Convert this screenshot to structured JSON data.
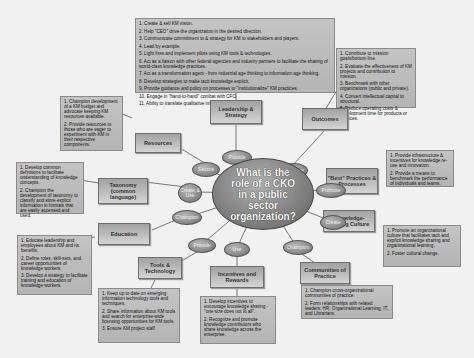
{
  "center": {
    "title": "What is the role of a CKO in a public sector organization?"
  },
  "nodes": {
    "leadership": "Leadership & Strategy",
    "outcomes": "Outcomes",
    "resources": "Resources",
    "taxonomy": "Taxonomy (common language)",
    "best_practices": "\"Best\" Practices & Processes",
    "knowledge_culture": "Knowledge-sharing Culture",
    "education": "Education",
    "tools": "Tools & Technology",
    "incentives": "Incentives and Rewards",
    "communities": "Communities of Practice"
  },
  "verbs": {
    "provide_top": "Provide",
    "secure": "Secure",
    "measure": "Measure",
    "create_use": "Create & Use",
    "promote": "Promote",
    "champion_left": "Champion",
    "create_right": "Create",
    "provide_bottom": "Provide",
    "use": "Use",
    "champion_right": "Champion"
  },
  "boxes": {
    "leadership": [
      "1. Create & sell KM vision.",
      "2. Help \"CEO\" drive the organization in the desired direction.",
      "3. Communicate commitment to & strategy for KM to stakeholders and players.",
      "4. Lead by example.",
      "5. Light fires and implement pilots using KM tools & technologies.",
      "6. Act as a liaison with other federal agencies and industry partners to facilitate the sharing of world-class knowledge practices.",
      "7. Act as a transformation agent - from industrial age thinking to information age thinking.",
      "8. Develop strategies to make tacit knowledge explicit.",
      "9. Provide guidance and policy on processes to \"institutionalize\" KM practices.",
      "10. Engage in \"hand-to-hand\" combat with CFO.",
      "11. Ability to translate qualitative into quantitative."
    ],
    "outcomes": [
      "1. Contribute to mission goals/bottom line.",
      "2. Evaluate the effectiveness of KM projects and contribution to mission.",
      "3. Benchmark with other organizations (public and private).",
      "4. Convert intellectual capital to structural.",
      "5. Reduce operating costs & development time for products or services."
    ],
    "resources": [
      "1. Champion development of a KM budget and advocate keeping KM resources available.",
      "2. Provide resources to those who are eager to experiment with KM in their respective components."
    ],
    "taxonomy": [
      "1. Develop common definitions to facilitate understanding of knowledge concepts.",
      "2. Champion the development of taxonomy to classify and store explicit information in formats that are easily accessed and used."
    ],
    "best_practices": [
      "1. Provide infrastructure & incentives for knowledge re-use and innovation.",
      "2. Provide a means to benchmark the performance of individuals and teams."
    ],
    "knowledge_culture": [
      "1. Promote an organizational culture that facilitates tacit and explicit knowledge sharing and organizational learning.",
      "2. Foster cultural change."
    ],
    "education": [
      "1. Educate leadership and employees about KM and its benefits.",
      "2. Define roles, skill-sets, and career opportunities of knowledge workers.",
      "3. Develop a strategy to facilitate training and education of knowledge workers."
    ],
    "tools": [
      "1. Keep up to date on emerging information technology tools and techniques.",
      "2. Share information about KM tools and search for enterprise-wide licensing opportunities for KM tools.",
      "3. Ensure KM project staff"
    ],
    "incentives": [
      "1. Develop incentives to encourage knowledge sharing - \"one size does not fit all\".",
      "2. Recognize and promote knowledge contributors who share knowledge across the enterprise."
    ],
    "communities": [
      "1. Champion cross-organizational communities of practice.",
      "2. Form relationships with related leaders: HR, Organizational Learning, IT, and Librarians."
    ]
  }
}
